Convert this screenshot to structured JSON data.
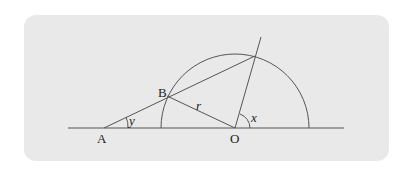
{
  "diagram": {
    "colors": {
      "panel": "#e9e9e9",
      "stroke": "#555555",
      "text": "#222222"
    },
    "labels": {
      "A": "A",
      "B": "B",
      "O": "O",
      "r": "r",
      "x": "x",
      "y": "y"
    },
    "points": {
      "A": [
        104,
        128
      ],
      "B": [
        167,
        96
      ],
      "O": [
        235,
        128
      ],
      "C": [
        255,
        56
      ]
    },
    "radius": 74
  }
}
